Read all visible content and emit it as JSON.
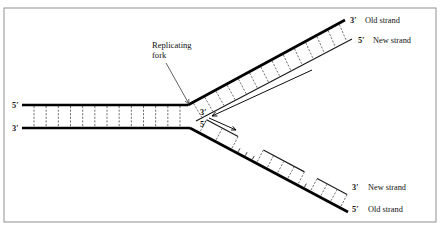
{
  "figure": {
    "background_color": "#ffffff",
    "frame_color": "#9a9a9a",
    "ink_color": "#000000"
  },
  "callout": {
    "line1": "Replicating",
    "line2": "fork"
  },
  "labels": {
    "parent_top_prime": "5′",
    "parent_bottom_prime": "3′",
    "fork_inner_top_prime": "3′",
    "fork_inner_bottom_prime": "5′",
    "upper_old_prime": "3′",
    "upper_old_text": "Old strand",
    "upper_new_prime": "5′",
    "upper_new_text": "New strand",
    "lower_new_prime": "3′",
    "lower_new_text": "New strand",
    "lower_old_prime": "5′",
    "lower_old_text": "Old strand"
  },
  "geometry": {
    "frame": {
      "x": 4,
      "y": 8,
      "width": 432,
      "height": 214
    },
    "parent_duplex": {
      "top_strand": {
        "x1": 22,
        "y1": 105,
        "x2": 188,
        "y2": 105
      },
      "bottom_strand": {
        "x1": 22,
        "y1": 128,
        "x2": 190,
        "y2": 128
      },
      "rung_count": 13,
      "rung_start_x": 34,
      "rung_end_x": 180
    },
    "upper_arm": {
      "template": {
        "x1": 188,
        "y1": 105,
        "x2": 345,
        "y2": 20
      },
      "new_strand": {
        "x1": 196,
        "y1": 121,
        "x2": 352,
        "y2": 39
      },
      "rung_count": 14,
      "arrow": {
        "x1": 312,
        "y1": 70,
        "x2": 212,
        "y2": 116
      }
    },
    "lower_arm": {
      "template": {
        "x1": 190,
        "y1": 128,
        "x2": 348,
        "y2": 212
      },
      "fragments": [
        {
          "start": 0.06,
          "end": 0.26,
          "rungs": 3
        },
        {
          "start": 0.42,
          "end": 0.68,
          "rungs": 5
        },
        {
          "start": 0.76,
          "end": 0.95,
          "rungs": 4
        }
      ],
      "gap_ticks": [
        0.3,
        0.345,
        0.39,
        0.72
      ],
      "arrow": {
        "x1": 209,
        "y1": 118,
        "x2": 236,
        "y2": 130
      }
    },
    "callout_arrow": {
      "x1": 166,
      "y1": 63,
      "x2": 189,
      "y2": 104
    }
  },
  "text_positions": {
    "callout_line1": {
      "x": 152,
      "y": 48
    },
    "callout_line2": {
      "x": 152,
      "y": 58
    },
    "parent_top_prime": {
      "x": 12,
      "y": 108
    },
    "parent_bottom_prime": {
      "x": 12,
      "y": 131
    },
    "fork_inner_top_prime": {
      "x": 200,
      "y": 115
    },
    "fork_inner_bottom_prime": {
      "x": 200,
      "y": 127
    },
    "upper_old_prime": {
      "x": 350,
      "y": 23
    },
    "upper_old_text": {
      "x": 365,
      "y": 23
    },
    "upper_new_prime": {
      "x": 358,
      "y": 43
    },
    "upper_new_text": {
      "x": 373,
      "y": 43
    },
    "lower_new_prime": {
      "x": 352,
      "y": 190
    },
    "lower_new_text": {
      "x": 368,
      "y": 190
    },
    "lower_old_prime": {
      "x": 352,
      "y": 212
    },
    "lower_old_text": {
      "x": 368,
      "y": 212
    }
  }
}
